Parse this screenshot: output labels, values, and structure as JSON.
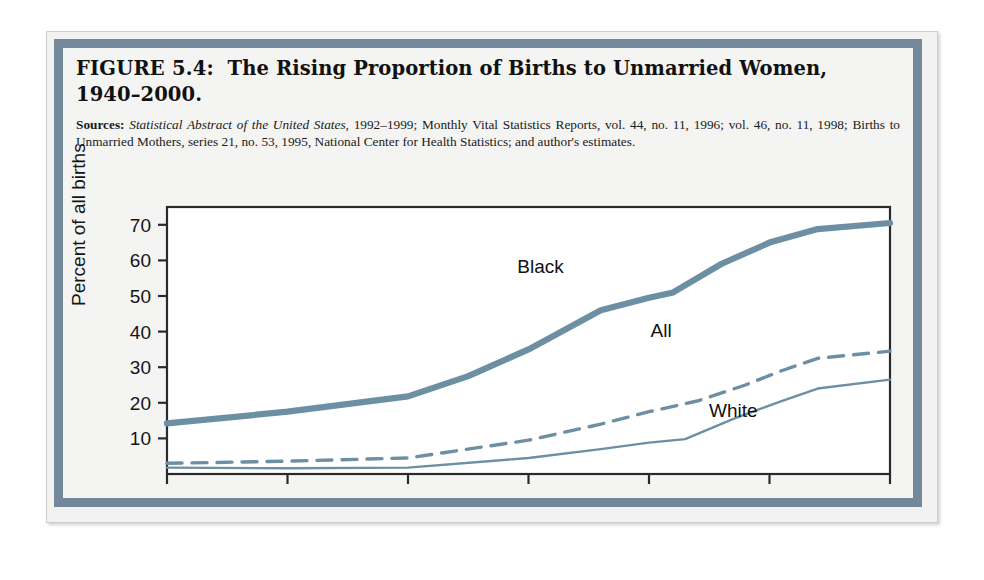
{
  "figure": {
    "number_label": "FIGURE 5.4:",
    "title_line1": "The Rising Proportion of Births to Unmarried Women,",
    "title_line2": "1940–2000.",
    "sources_label": "Sources:",
    "sources_italic": "Statistical Abstract of the United States,",
    "sources_rest": " 1992–1999; Monthly Vital Statistics Reports, vol. 44, no. 11, 1996; vol. 46, no. 11, 1998; Births to Unmarried Mothers, series 21, no. 53, 1995, National Center for Health Statistics; and author's estimates."
  },
  "colors": {
    "line": "#6d8fa3",
    "frame_band": "#73889b",
    "axis": "#2a2a2a",
    "plot_bg": "#ffffff",
    "page_bg": "#f4f4f2"
  },
  "chart_data": {
    "type": "line",
    "xlabel": "",
    "ylabel": "Percent of all births",
    "xlim": [
      1940,
      2000
    ],
    "ylim": [
      0,
      75
    ],
    "xticks": [
      1940,
      1950,
      1960,
      1970,
      1980,
      1990,
      2000
    ],
    "xtick_labels": [
      "1940",
      "1950",
      "1960",
      "1970",
      "1980",
      "1990",
      "2000"
    ],
    "yticks": [
      10,
      20,
      30,
      40,
      50,
      60,
      70
    ],
    "ytick_labels": [
      "10",
      "20",
      "30",
      "40",
      "50",
      "60",
      "70"
    ],
    "grid": false,
    "legend": "inline-annotations",
    "series": [
      {
        "name": "Black",
        "style": "solid-thick",
        "label_x": 1971,
        "label_y": 56.5,
        "x": [
          1940,
          1950,
          1960,
          1965,
          1970,
          1976,
          1980,
          1982,
          1986,
          1990,
          1994,
          2000
        ],
        "values": [
          14.2,
          17.5,
          21.8,
          27.5,
          35.0,
          46.0,
          49.5,
          51.0,
          59.0,
          65.0,
          68.8,
          70.5
        ]
      },
      {
        "name": "All",
        "style": "dashed",
        "label_x": 1981,
        "label_y": 38.5,
        "x": [
          1940,
          1950,
          1960,
          1970,
          1976,
          1980,
          1984,
          1988,
          1991,
          1994,
          2000
        ],
        "values": [
          3.0,
          3.6,
          4.5,
          9.5,
          14.0,
          17.5,
          20.5,
          25.0,
          29.0,
          32.5,
          34.5
        ]
      },
      {
        "name": "White",
        "style": "solid-thin",
        "label_x": 1987,
        "label_y": 16.0,
        "x": [
          1940,
          1950,
          1960,
          1970,
          1976,
          1980,
          1983,
          1987,
          1991,
          1994,
          2000
        ],
        "values": [
          1.8,
          1.6,
          1.8,
          4.5,
          7.0,
          8.8,
          9.8,
          15.5,
          20.5,
          24.0,
          26.5
        ]
      }
    ]
  }
}
